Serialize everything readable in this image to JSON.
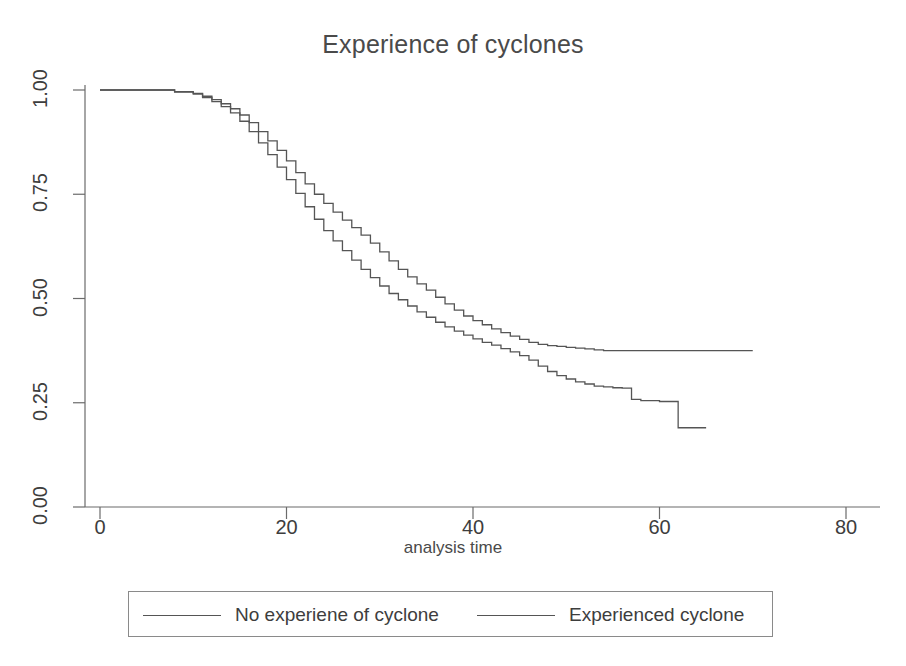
{
  "chart_data": {
    "type": "line",
    "title": "Experience of cyclones",
    "xlabel": "analysis time",
    "ylabel": "",
    "xlim": [
      0,
      80
    ],
    "ylim": [
      0,
      1
    ],
    "grid": false,
    "legend_position": "bottom",
    "step": "post",
    "x_ticks": [
      0,
      20,
      40,
      60,
      80
    ],
    "x_tick_labels": [
      "0",
      "20",
      "40",
      "60",
      "80"
    ],
    "y_ticks": [
      0.0,
      0.25,
      0.5,
      0.75,
      1.0
    ],
    "y_tick_labels": [
      "0.00",
      "0.25",
      "0.50",
      "0.75",
      "1.00"
    ],
    "series": [
      {
        "name": "No experiene of cyclone",
        "color": "#555555",
        "x": [
          0,
          6,
          8,
          10,
          11,
          12,
          13,
          14,
          15,
          16,
          17,
          18,
          19,
          20,
          21,
          22,
          23,
          24,
          25,
          26,
          27,
          28,
          29,
          30,
          31,
          32,
          33,
          34,
          35,
          36,
          37,
          38,
          39,
          40,
          41,
          42,
          43,
          44,
          45,
          46,
          47,
          48,
          49,
          50,
          51,
          52,
          53,
          54,
          55,
          56,
          57,
          58,
          60,
          62,
          65
        ],
        "values": [
          1.0,
          1.0,
          0.995,
          0.99,
          0.982,
          0.972,
          0.96,
          0.945,
          0.925,
          0.9,
          0.873,
          0.845,
          0.815,
          0.785,
          0.752,
          0.72,
          0.69,
          0.663,
          0.638,
          0.615,
          0.592,
          0.57,
          0.55,
          0.53,
          0.512,
          0.497,
          0.482,
          0.468,
          0.455,
          0.443,
          0.432,
          0.422,
          0.412,
          0.403,
          0.395,
          0.388,
          0.38,
          0.372,
          0.363,
          0.352,
          0.338,
          0.325,
          0.315,
          0.307,
          0.3,
          0.295,
          0.29,
          0.288,
          0.286,
          0.285,
          0.258,
          0.255,
          0.253,
          0.19,
          0.19
        ]
      },
      {
        "name": "Experienced cyclone",
        "color": "#555555",
        "x": [
          0,
          6,
          8,
          10,
          11,
          12,
          13,
          14,
          15,
          16,
          17,
          18,
          19,
          20,
          21,
          22,
          23,
          24,
          25,
          26,
          27,
          28,
          29,
          30,
          31,
          32,
          33,
          34,
          35,
          36,
          37,
          38,
          39,
          40,
          41,
          42,
          43,
          44,
          45,
          46,
          47,
          48,
          49,
          50,
          51,
          52,
          53,
          54,
          70
        ],
        "values": [
          1.0,
          1.0,
          0.996,
          0.992,
          0.985,
          0.977,
          0.967,
          0.955,
          0.94,
          0.922,
          0.9,
          0.878,
          0.855,
          0.83,
          0.802,
          0.775,
          0.75,
          0.728,
          0.707,
          0.688,
          0.67,
          0.652,
          0.633,
          0.612,
          0.59,
          0.57,
          0.552,
          0.535,
          0.52,
          0.503,
          0.487,
          0.472,
          0.458,
          0.447,
          0.437,
          0.427,
          0.418,
          0.41,
          0.402,
          0.395,
          0.39,
          0.387,
          0.385,
          0.383,
          0.381,
          0.379,
          0.377,
          0.375,
          0.375
        ]
      }
    ]
  },
  "legend": {
    "entries": [
      {
        "label": "No experiene of cyclone"
      },
      {
        "label": "Experienced cyclone"
      }
    ]
  }
}
